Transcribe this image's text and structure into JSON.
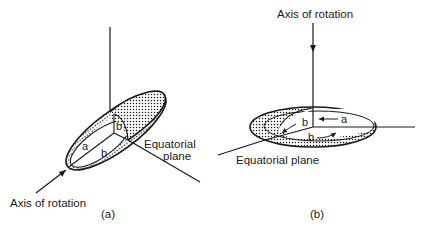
{
  "panels": [
    {
      "id": "a",
      "caption": "(a)",
      "labels": {
        "axis": "Axis of rotation",
        "plane_line1": "Equatorial",
        "plane_line2": "plane",
        "semi_major": "a",
        "semi_minor_equatorial": "b",
        "semi_minor_vertical": "b"
      }
    },
    {
      "id": "b",
      "caption": "(b)",
      "labels": {
        "axis": "Axis of rotation",
        "plane": "Equatorial plane",
        "semi_major": "a",
        "semi_minor_1": "b",
        "semi_minor_2": "b"
      }
    }
  ],
  "colors": {
    "ink": "#1a1a1a",
    "background": "#ffffff"
  }
}
